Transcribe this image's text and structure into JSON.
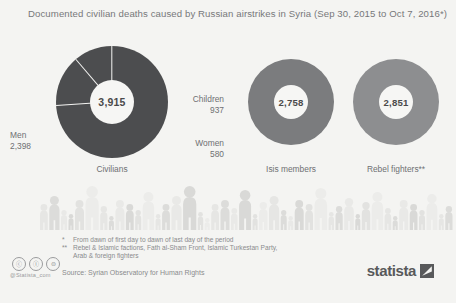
{
  "title": "Documented civilian deaths caused by Russian airstrikes in Syria (Sep 30, 2015 to Oct 7, 2016*)",
  "charts": [
    {
      "id": "civilians",
      "caption": "Civilians",
      "center_value": "3,915",
      "color": "#4c4d4f",
      "segments": [
        {
          "label": "Children",
          "value": "937",
          "number": 937
        },
        {
          "label": "Women",
          "value": "580",
          "number": 580
        },
        {
          "label": "Men",
          "value": "2,398",
          "number": 2398
        }
      ]
    },
    {
      "id": "isis",
      "caption": "Isis members",
      "center_value": "2,758",
      "color": "#7b7c7e",
      "segments": []
    },
    {
      "id": "rebels",
      "caption": "Rebel fighters**",
      "center_value": "2,851",
      "color": "#8d8e90",
      "segments": []
    }
  ],
  "footnotes": [
    {
      "mark": "*",
      "text": "From dawn of first day to dawn of last day of the period"
    },
    {
      "mark": "**",
      "text": "Rebel & Islamic factions, Fath al-Sham Front, Islamic Turkestan Party,"
    },
    {
      "mark": "",
      "text": "Arab & foreign fighters"
    }
  ],
  "source": "Source: Syrian Observatory for Human Rights",
  "cc": {
    "badges": [
      "cc-icon",
      "cc-by-icon",
      "cc-nd-icon"
    ],
    "glyphs": [
      "ⓒ",
      "Ⓘ",
      "⊜"
    ],
    "handle": "@Statista_com"
  },
  "logo": {
    "word": "statista"
  },
  "colors": {
    "background": "#f4f4f2",
    "text": "#6f7072",
    "civilians": "#4c4d4f",
    "isis": "#7b7c7e",
    "rebels": "#8d8e90",
    "hole": "#f6f6f4",
    "people": "#e3e3e1"
  },
  "chart_data": {
    "type": "pie",
    "title": "Documented civilian deaths caused by Russian airstrikes in Syria (Sep 30, 2015 to Oct 7, 2016*)",
    "xlabel": "",
    "ylabel": "Deaths",
    "grid": false,
    "legend": "inline-labels",
    "groups": [
      {
        "name": "Civilians",
        "total": 3915,
        "categories": [
          "Children",
          "Women",
          "Men"
        ],
        "values": [
          937,
          580,
          2398
        ]
      },
      {
        "name": "Isis members",
        "total": 2758,
        "categories": [
          "Isis members"
        ],
        "values": [
          2758
        ]
      },
      {
        "name": "Rebel fighters**",
        "total": 2851,
        "categories": [
          "Rebel fighters"
        ],
        "values": [
          2851
        ]
      }
    ],
    "source": "Source: Syrian Observatory for Human Rights"
  }
}
